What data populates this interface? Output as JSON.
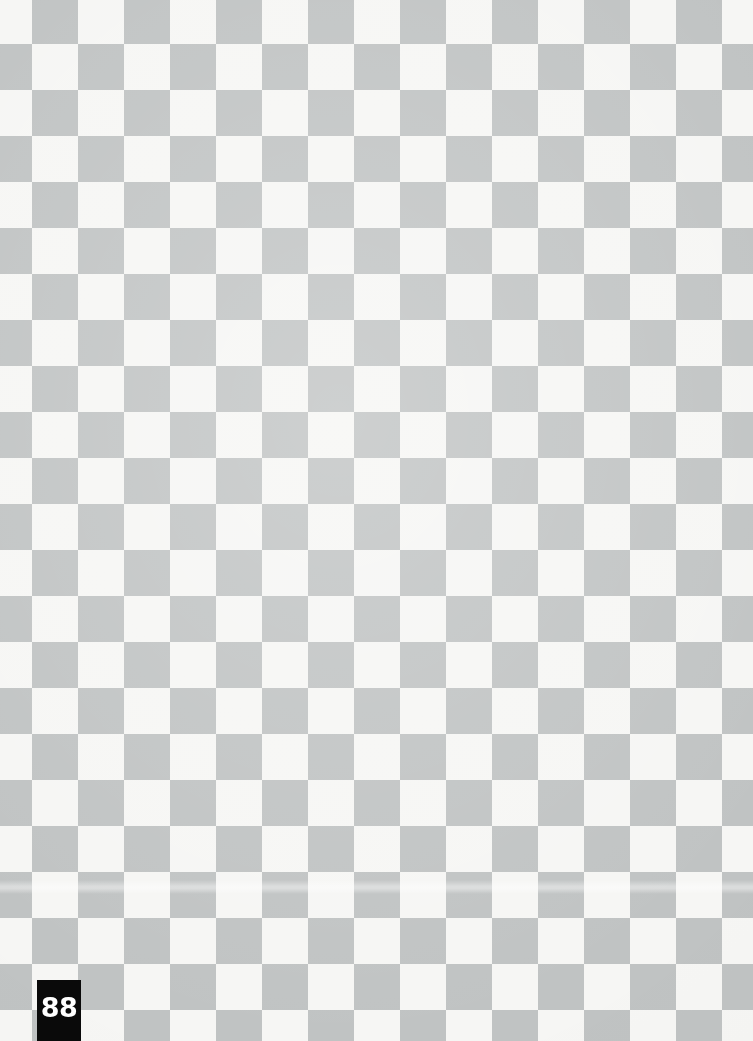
{
  "page": {
    "width": 753,
    "height": 1041,
    "kind": "scanned-book-page",
    "background_description": "checkerboard pattern of light gray and off-white squares"
  },
  "page_number": {
    "label": "88",
    "tab_background_color": "#0a0a0a",
    "tab_text_color": "#ffffff",
    "position": "bottom-left"
  },
  "pattern": {
    "square_size_px": 46,
    "light_color": "#f8f8f6",
    "dark_color": "#c2c5c5",
    "columns": 17,
    "rows": 23
  },
  "artifacts": {
    "scan_band_label": "scanner light band"
  }
}
